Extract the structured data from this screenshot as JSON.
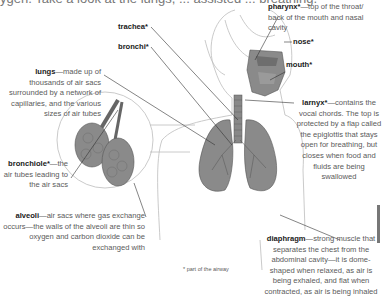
{
  "header": {
    "cut_text": "ygen. Take a look at the lungs, ... assisted ... breathing."
  },
  "labels": {
    "trachea": {
      "term": "trachea*",
      "desc": ""
    },
    "bronchi": {
      "term": "bronchi*",
      "desc": ""
    },
    "lungs": {
      "term": "lungs",
      "desc": "—made up of thousands of air sacs surrounded by a network of capillaries, and the various sizes of air tubes"
    },
    "bronchiole": {
      "term": "bronchiole*",
      "desc": "—the air tubes leading to the air sacs"
    },
    "alveoli": {
      "term": "alveoli",
      "desc": "—air sacs where gas exchange occurs—the walls of the alveoli are thin so oxygen and carbon dioxide can be exchanged with"
    },
    "pharynx": {
      "term": "pharynx*",
      "desc": "—top of the throat/ back of the mouth and nasal cavity"
    },
    "nose": {
      "term": "nose*",
      "desc": ""
    },
    "mouth": {
      "term": "mouth*",
      "desc": ""
    },
    "larnyx": {
      "term": "larnyx*",
      "desc": "—contains the vocal chords. The top is protected by a flap called the epiglottis that stays open for breathing, but closes when food and fluids are being swallowed"
    },
    "diaphragm": {
      "term": "diaphragm",
      "desc": "—strong muscle that separates the chest from the abdominal cavity—it is dome-shaped when relaxed, as air is being exhaled, and flat when contracted, as air is being inhaled"
    }
  },
  "footnote": "* part of the airway",
  "colors": {
    "organ_fill": "#8a8a8a",
    "line": "#333333",
    "outline": "#bbbbbb"
  }
}
